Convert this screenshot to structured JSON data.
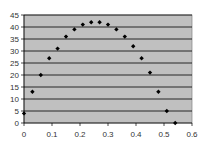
{
  "chart_data": {
    "type": "scatter",
    "title": "",
    "xlabel": "",
    "ylabel": "",
    "xlim": [
      0,
      0.6
    ],
    "ylim": [
      0,
      45
    ],
    "x_ticks": [
      "0",
      "0.1",
      "0.2",
      "0.3",
      "0.4",
      "0.5",
      "0.6"
    ],
    "y_ticks": [
      "0",
      "5",
      "10",
      "15",
      "20",
      "25",
      "30",
      "35",
      "40",
      "45"
    ],
    "grid": "horizontal",
    "legend": "none",
    "plot_background": "#c0c0c0",
    "marker_color": "#000000",
    "series": [
      {
        "name": "Series1",
        "x": [
          0.0,
          0.03,
          0.06,
          0.09,
          0.12,
          0.15,
          0.18,
          0.21,
          0.24,
          0.27,
          0.3,
          0.33,
          0.36,
          0.39,
          0.42,
          0.45,
          0.48,
          0.51,
          0.54
        ],
        "y": [
          4,
          13,
          20,
          27,
          31,
          36,
          39,
          41,
          42,
          42,
          41,
          39,
          36,
          32,
          27,
          21,
          13,
          5,
          0
        ]
      }
    ]
  }
}
